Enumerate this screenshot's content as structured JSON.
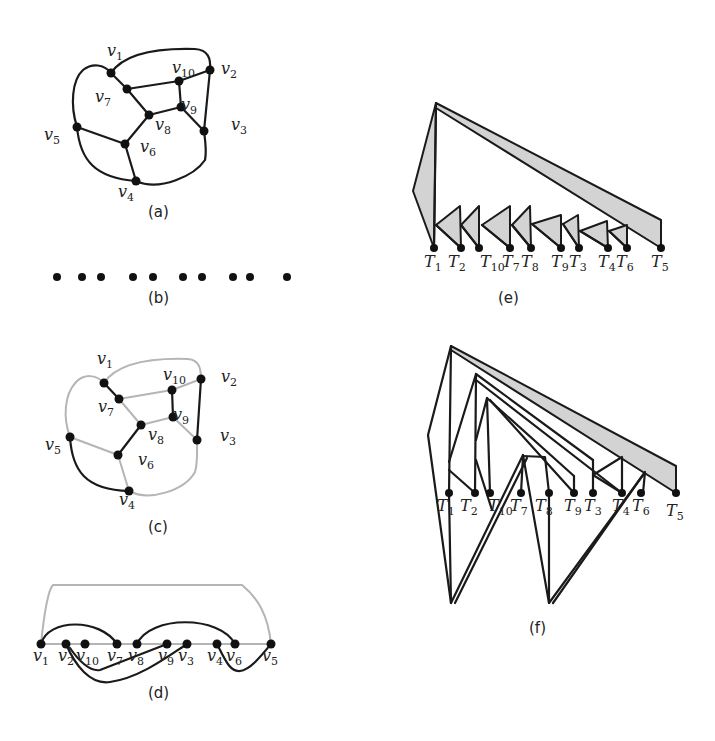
{
  "figure": {
    "panels": [
      {
        "id": "a",
        "caption": "(a)",
        "description": "Planar graph with 10 vertices"
      },
      {
        "id": "b",
        "caption": "(b)",
        "description": "10 isolated vertices on a line"
      },
      {
        "id": "c",
        "caption": "(c)",
        "description": "Graph with highlighted matching edges"
      },
      {
        "id": "d",
        "caption": "(d)",
        "description": "Linear layout of vertices with arcs"
      },
      {
        "id": "e",
        "caption": "(e)",
        "description": "Tree decomposition with shaded triangles"
      },
      {
        "id": "f",
        "caption": "(f)",
        "description": "Tree decomposition with zigzag structure"
      }
    ]
  },
  "graph": {
    "vertex_labels": [
      "v1",
      "v2",
      "v3",
      "v4",
      "v5",
      "v6",
      "v7",
      "v8",
      "v9",
      "v10"
    ],
    "edges": [
      [
        "v1",
        "v2"
      ],
      [
        "v1",
        "v7"
      ],
      [
        "v1",
        "v5"
      ],
      [
        "v2",
        "v10"
      ],
      [
        "v2",
        "v3"
      ],
      [
        "v7",
        "v10"
      ],
      [
        "v7",
        "v8"
      ],
      [
        "v10",
        "v9"
      ],
      [
        "v9",
        "v8"
      ],
      [
        "v9",
        "v3"
      ],
      [
        "v8",
        "v6"
      ],
      [
        "v5",
        "v6"
      ],
      [
        "v5",
        "v4"
      ],
      [
        "v6",
        "v4"
      ],
      [
        "v4",
        "v3"
      ]
    ],
    "highlighted_edges_c": [
      [
        "v1",
        "v7"
      ],
      [
        "v10",
        "v9"
      ],
      [
        "v2",
        "v3"
      ],
      [
        "v8",
        "v6"
      ],
      [
        "v5",
        "v4"
      ]
    ]
  },
  "labels": {
    "a": {
      "v1": "v",
      "v1s": "1",
      "v2": "v",
      "v2s": "2",
      "v3": "v",
      "v3s": "3",
      "v4": "v",
      "v4s": "4",
      "v5": "v",
      "v5s": "5",
      "v6": "v",
      "v6s": "6",
      "v7": "v",
      "v7s": "7",
      "v8": "v",
      "v8s": "8",
      "v9": "v",
      "v9s": "9",
      "v10": "v",
      "v10s": "10"
    },
    "d_order": [
      "v1",
      "v2",
      "v10",
      "v7",
      "v8",
      "v9",
      "v3",
      "v4",
      "v6",
      "v5"
    ],
    "d_subs": [
      "1",
      "2",
      "10",
      "7",
      "8",
      "9",
      "3",
      "4",
      "6",
      "5"
    ],
    "tree_order": [
      "T1",
      "T2",
      "T10",
      "T7",
      "T8",
      "T9",
      "T3",
      "T4",
      "T6",
      "T5"
    ],
    "tree_subs": [
      "1",
      "2",
      "10",
      "7",
      "8",
      "9",
      "3",
      "4",
      "6",
      "5"
    ],
    "v": "v",
    "T": "T"
  },
  "colors": {
    "edge": "#1a1a1a",
    "edge_light": "#b5b5b5",
    "shade": "#d3d3d3",
    "background": "#ffffff"
  }
}
